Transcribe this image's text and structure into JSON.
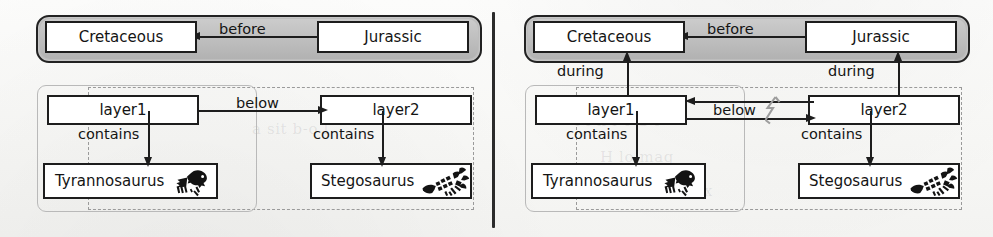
{
  "figure": {
    "type": "diagram",
    "panel_count": 2,
    "divider": "vertical-rule"
  },
  "ghost_text": [
    {
      "text": "a sit  b-o l",
      "x": 252,
      "y": 120
    },
    {
      "text": "l  i n  l o a  c",
      "x": 575,
      "y": 112
    },
    {
      "text": "H  lo  mag",
      "x": 600,
      "y": 148
    },
    {
      "text": "t  h  s c  r n  ex",
      "x": 610,
      "y": 182
    }
  ],
  "panels": [
    {
      "id": "left",
      "name": "panel-without-during-edges",
      "period_band": {
        "label": "period-group",
        "fill": "#bdbdbd"
      },
      "nodes": [
        {
          "id": "cretaceous",
          "label": "Cretaceous",
          "kind": "period"
        },
        {
          "id": "jurassic",
          "label": "Jurassic",
          "kind": "period"
        },
        {
          "id": "layer1",
          "label": "layer1",
          "kind": "layer"
        },
        {
          "id": "layer2",
          "label": "layer2",
          "kind": "layer"
        },
        {
          "id": "tyrannosaurus",
          "label": "Tyrannosaurus",
          "kind": "species",
          "icon": "tyrannosaurus-icon"
        },
        {
          "id": "stegosaurus",
          "label": "Stegosaurus",
          "kind": "species",
          "icon": "stegosaurus-icon"
        }
      ],
      "edges": [
        {
          "id": "before",
          "label": "before",
          "from": "jurassic",
          "to": "cretaceous",
          "direction": "left"
        },
        {
          "id": "below",
          "label": "below",
          "from": "layer1",
          "to": "layer2",
          "direction": "right"
        },
        {
          "id": "contains1",
          "label": "contains",
          "from": "layer1",
          "to": "tyrannosaurus",
          "direction": "down"
        },
        {
          "id": "contains2",
          "label": "contains",
          "from": "layer2",
          "to": "stegosaurus",
          "direction": "down"
        }
      ],
      "groups": [
        {
          "id": "group-solid-left",
          "style": "solid-rounded",
          "contains": [
            "layer1",
            "tyrannosaurus"
          ]
        },
        {
          "id": "group-dashed-left",
          "style": "dashed",
          "contains": [
            "layer1",
            "layer2",
            "tyrannosaurus",
            "stegosaurus"
          ]
        }
      ]
    },
    {
      "id": "right",
      "name": "panel-with-during-edges-and-conflict",
      "period_band": {
        "label": "period-group",
        "fill": "#bdbdbd"
      },
      "nodes": [
        {
          "id": "cretaceous",
          "label": "Cretaceous",
          "kind": "period"
        },
        {
          "id": "jurassic",
          "label": "Jurassic",
          "kind": "period"
        },
        {
          "id": "layer1",
          "label": "layer1",
          "kind": "layer"
        },
        {
          "id": "layer2",
          "label": "layer2",
          "kind": "layer"
        },
        {
          "id": "tyrannosaurus",
          "label": "Tyrannosaurus",
          "kind": "species",
          "icon": "tyrannosaurus-icon"
        },
        {
          "id": "stegosaurus",
          "label": "Stegosaurus",
          "kind": "species",
          "icon": "stegosaurus-icon"
        }
      ],
      "edges": [
        {
          "id": "before",
          "label": "before",
          "from": "jurassic",
          "to": "cretaceous",
          "direction": "left"
        },
        {
          "id": "during1",
          "label": "during",
          "from": "layer1",
          "to": "cretaceous",
          "direction": "up"
        },
        {
          "id": "during2",
          "label": "during",
          "from": "layer2",
          "to": "jurassic",
          "direction": "up"
        },
        {
          "id": "below-fwd",
          "label": "below",
          "from": "layer1",
          "to": "layer2",
          "direction": "right",
          "conflict": true
        },
        {
          "id": "below-back",
          "label": "",
          "from": "layer2",
          "to": "layer1",
          "direction": "left"
        },
        {
          "id": "contains1",
          "label": "contains",
          "from": "layer1",
          "to": "tyrannosaurus",
          "direction": "down"
        },
        {
          "id": "contains2",
          "label": "contains",
          "from": "layer2",
          "to": "stegosaurus",
          "direction": "down"
        }
      ],
      "conflict_marker": {
        "id": "conflict-bolt",
        "icon": "lightning-bolt-icon",
        "color": "#9d9d9d"
      },
      "groups": [
        {
          "id": "group-solid-right",
          "style": "solid-rounded",
          "contains": [
            "layer1",
            "tyrannosaurus"
          ]
        },
        {
          "id": "group-dashed-right",
          "style": "dashed",
          "contains": [
            "layer1",
            "layer2",
            "tyrannosaurus",
            "stegosaurus"
          ]
        }
      ]
    }
  ]
}
